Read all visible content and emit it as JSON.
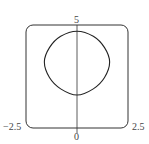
{
  "chart_data": {
    "type": "line",
    "title": "",
    "xlabel": "",
    "ylabel": "",
    "xlim": [
      -2.5,
      2.5
    ],
    "ylim": [
      0,
      5
    ],
    "tick_labels": {
      "x_left": "−2.5",
      "x_right": "2.5",
      "x_origin": "0",
      "y_top": "5"
    },
    "grid": false,
    "legend": null,
    "series": [
      {
        "name": "closed curve",
        "description": "Closed rounded-square-like loop symmetric about the y-axis",
        "points": [
          {
            "x": 0,
            "y": 4.7
          },
          {
            "x": 0.8,
            "y": 4.45
          },
          {
            "x": 1.35,
            "y": 3.9
          },
          {
            "x": 1.6,
            "y": 3.2
          },
          {
            "x": 1.35,
            "y": 2.45
          },
          {
            "x": 0.8,
            "y": 1.9
          },
          {
            "x": 0,
            "y": 1.6
          },
          {
            "x": -0.8,
            "y": 1.9
          },
          {
            "x": -1.35,
            "y": 2.45
          },
          {
            "x": -1.6,
            "y": 3.2
          },
          {
            "x": -1.35,
            "y": 3.9
          },
          {
            "x": -0.8,
            "y": 4.45
          }
        ]
      }
    ]
  },
  "labels": {
    "y_top": "5",
    "x_left": "−2.5",
    "x_right": "2.5",
    "x_origin": "0"
  }
}
